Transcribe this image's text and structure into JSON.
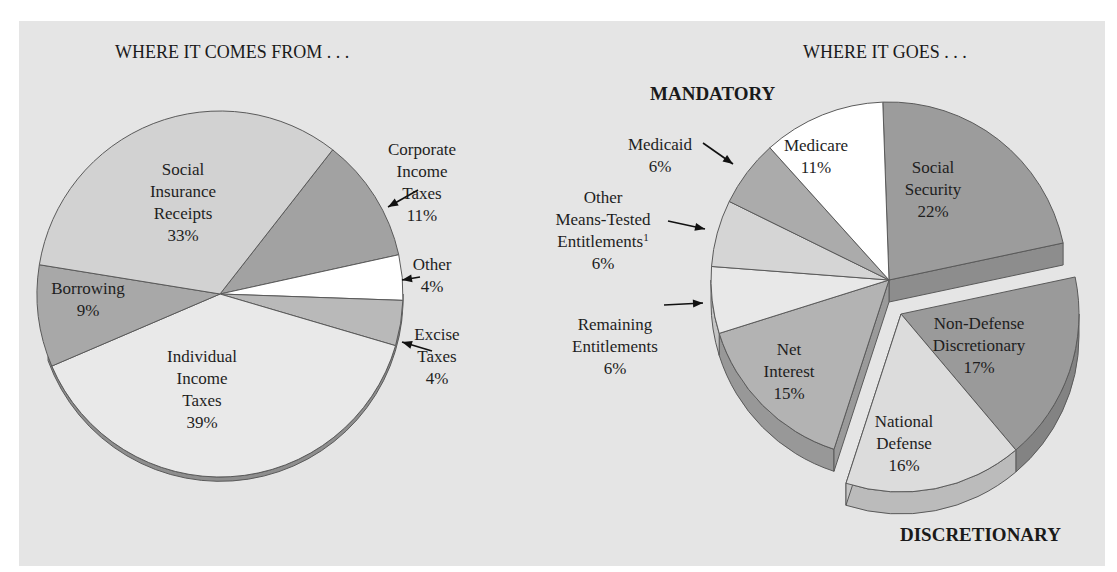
{
  "chart_data": [
    {
      "type": "pie",
      "title": "WHERE IT COMES FROM . . .",
      "slices": [
        {
          "label": "Social Insurance Receipts",
          "lines": [
            "Social",
            "Insurance",
            "Receipts"
          ],
          "value": 33,
          "display": "33%",
          "color": "#d2d2d2"
        },
        {
          "label": "Corporate Income Taxes",
          "lines": [
            "Corporate",
            "Income",
            "Taxes"
          ],
          "value": 11,
          "display": "11%",
          "color": "#a2a2a2"
        },
        {
          "label": "Other",
          "lines": [
            "Other"
          ],
          "value": 4,
          "display": "4%",
          "color": "#ffffff"
        },
        {
          "label": "Excise Taxes",
          "lines": [
            "Excise",
            "Taxes"
          ],
          "value": 4,
          "display": "4%",
          "color": "#b9b9b9"
        },
        {
          "label": "Individual Income Taxes",
          "lines": [
            "Individual",
            "Income",
            "Taxes"
          ],
          "value": 39,
          "display": "39%",
          "color": "#e9e9e9"
        },
        {
          "label": "Borrowing",
          "lines": [
            "Borrowing"
          ],
          "value": 9,
          "display": "9%",
          "color": "#a8a8a8"
        }
      ]
    },
    {
      "type": "pie",
      "title": "WHERE IT GOES . . .",
      "group_labels": {
        "mandatory": "MANDATORY",
        "discretionary": "DISCRETIONARY"
      },
      "slices": [
        {
          "label": "Social Security",
          "lines": [
            "Social",
            "Security"
          ],
          "value": 22,
          "display": "22%",
          "group": "mandatory",
          "color": "#9c9c9c"
        },
        {
          "label": "Non-Defense Discretionary",
          "lines": [
            "Non-Defense",
            "Discretionary"
          ],
          "value": 17,
          "display": "17%",
          "group": "discretionary",
          "color": "#9a9a9a"
        },
        {
          "label": "National Defense",
          "lines": [
            "National",
            "Defense"
          ],
          "value": 16,
          "display": "16%",
          "group": "discretionary",
          "color": "#dcdcdc"
        },
        {
          "label": "Net Interest",
          "lines": [
            "Net",
            "Interest"
          ],
          "value": 15,
          "display": "15%",
          "group": "mandatory",
          "color": "#b3b3b3"
        },
        {
          "label": "Remaining Entitlements",
          "lines": [
            "Remaining",
            "Entitlements"
          ],
          "value": 6,
          "display": "6%",
          "group": "mandatory",
          "color": "#e8e8e8"
        },
        {
          "label": "Other Means-Tested Entitlements",
          "lines": [
            "Other",
            "Means-Tested",
            "Entitlements"
          ],
          "footnote": "1",
          "value": 6,
          "display": "6%",
          "group": "mandatory",
          "color": "#d5d5d5"
        },
        {
          "label": "Medicaid",
          "lines": [
            "Medicaid"
          ],
          "value": 6,
          "display": "6%",
          "group": "mandatory",
          "color": "#ababab"
        },
        {
          "label": "Medicare",
          "lines": [
            "Medicare"
          ],
          "value": 11,
          "display": "11%",
          "group": "mandatory",
          "color": "#ffffff"
        }
      ]
    }
  ]
}
